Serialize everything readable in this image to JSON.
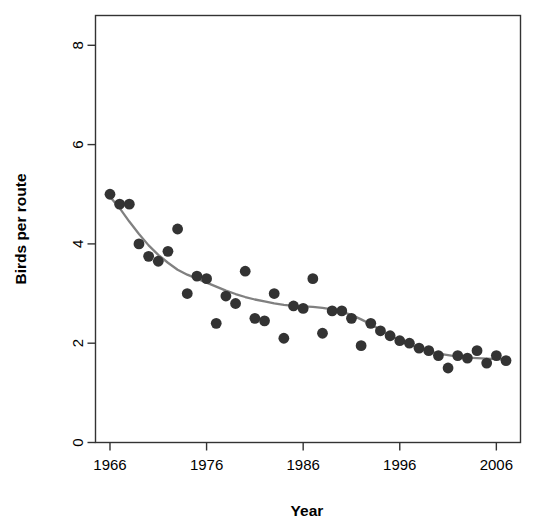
{
  "chart_data": {
    "type": "scatter",
    "title": "",
    "subtitle": "",
    "xlabel": "Year",
    "ylabel": "Birds per route",
    "xlim": [
      1964.5,
      2008.5
    ],
    "ylim": [
      0,
      8.6
    ],
    "xticks": [
      1966,
      1976,
      1986,
      1996,
      2006
    ],
    "xtick_labels": [
      "1966",
      "1976",
      "1986",
      "1996",
      "2006"
    ],
    "yticks": [
      0,
      2,
      4,
      6,
      8
    ],
    "ytick_labels": [
      "0",
      "2",
      "4",
      "6",
      "8"
    ],
    "grid": false,
    "legend": "none",
    "point_color": "#333333",
    "line_color": "#808080",
    "axis_color": "#333333",
    "x": [
      1966,
      1967,
      1968,
      1969,
      1970,
      1971,
      1972,
      1973,
      1974,
      1975,
      1976,
      1977,
      1978,
      1979,
      1980,
      1981,
      1982,
      1983,
      1984,
      1985,
      1986,
      1987,
      1988,
      1989,
      1990,
      1991,
      1992,
      1993,
      1994,
      1995,
      1996,
      1997,
      1998,
      1999,
      2000,
      2001,
      2002,
      2003,
      2004,
      2005,
      2006,
      2007
    ],
    "y": [
      5.0,
      4.8,
      4.8,
      4.0,
      3.75,
      3.65,
      3.85,
      4.3,
      3.0,
      3.35,
      3.3,
      2.4,
      2.95,
      2.8,
      3.45,
      2.5,
      2.45,
      3.0,
      2.1,
      2.75,
      2.7,
      3.3,
      2.2,
      2.65,
      2.65,
      2.5,
      1.95,
      2.4,
      2.25,
      2.15,
      2.05,
      2.0,
      1.9,
      1.85,
      1.75,
      1.5,
      1.75,
      1.7,
      1.85,
      1.6,
      1.75,
      1.65
    ],
    "series": [
      {
        "name": "Birds per route",
        "type": "scatter",
        "marker": "filled-circle",
        "values": [
          5.0,
          4.8,
          4.8,
          4.0,
          3.75,
          3.65,
          3.85,
          4.3,
          3.0,
          3.35,
          3.3,
          2.4,
          2.95,
          2.8,
          3.45,
          2.5,
          2.45,
          3.0,
          2.1,
          2.75,
          2.7,
          3.3,
          2.2,
          2.65,
          2.65,
          2.5,
          1.95,
          2.4,
          2.25,
          2.15,
          2.05,
          2.0,
          1.9,
          1.85,
          1.75,
          1.5,
          1.75,
          1.7,
          1.85,
          1.6,
          1.75,
          1.65
        ]
      },
      {
        "name": "smoothed trend",
        "type": "line",
        "x": [
          1966,
          1967,
          1968,
          1969,
          1970,
          1971,
          1972,
          1973,
          1974,
          1975,
          1976,
          1977,
          1978,
          1979,
          1980,
          1981,
          1982,
          1983,
          1984,
          1985,
          1986,
          1987,
          1988,
          1989,
          1990,
          1991,
          1992,
          1993,
          1994,
          1995,
          1996,
          1997,
          1998,
          1999,
          2000,
          2001,
          2002,
          2003,
          2004,
          2005,
          2006,
          2007
        ],
        "values": [
          4.95,
          4.72,
          4.45,
          4.2,
          3.97,
          3.78,
          3.62,
          3.48,
          3.38,
          3.3,
          3.22,
          3.14,
          3.06,
          2.99,
          2.93,
          2.88,
          2.84,
          2.8,
          2.77,
          2.75,
          2.74,
          2.73,
          2.71,
          2.68,
          2.63,
          2.57,
          2.48,
          2.38,
          2.27,
          2.16,
          2.06,
          1.97,
          1.9,
          1.84,
          1.79,
          1.76,
          1.73,
          1.71,
          1.7,
          1.69,
          1.68,
          1.67
        ]
      }
    ]
  },
  "axes": {
    "x_title": "Year",
    "y_title": "Birds per route"
  }
}
